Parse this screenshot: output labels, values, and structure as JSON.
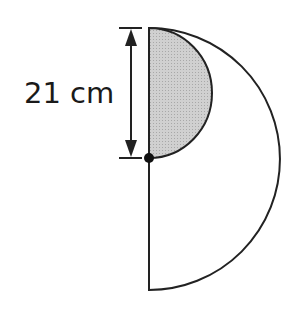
{
  "diagram": {
    "type": "geometry",
    "dimension_label": "21 cm",
    "dimension_refers_to": "diameter of small shaded semicircle",
    "shapes": {
      "large_semicircle": {
        "fill": "#ffffff",
        "stroke": "#222222"
      },
      "small_semicircle": {
        "fill": "#c8c8c8",
        "stroke": "#222222",
        "shaded": true
      },
      "center_point": {
        "fill": "#111111"
      }
    }
  }
}
